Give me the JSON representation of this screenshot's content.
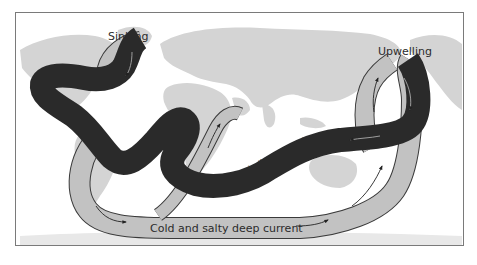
{
  "diagram": {
    "type": "thermohaline-circulation-map",
    "labels": {
      "sinking": "Sinking",
      "upwelling": "Upwelling",
      "warm_current": "Warm shallow current",
      "cold_current": "Cold and salty deep current"
    },
    "colors": {
      "background": "#ffffff",
      "land": "#d4d4d4",
      "warm_current": "#2a2a2a",
      "cold_current": "#c2c2c2",
      "outline": "#3a3a3a",
      "frame": "#7a7a7a"
    }
  }
}
